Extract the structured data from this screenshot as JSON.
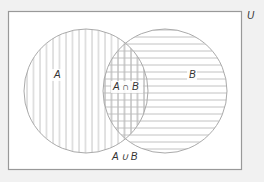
{
  "diagram": {
    "type": "venn",
    "universe_label": "U",
    "sets": [
      {
        "id": "A",
        "label": "A",
        "hatch": "vertical",
        "cx": 86,
        "cy": 91,
        "r": 62
      },
      {
        "id": "B",
        "label": "B",
        "hatch": "horizontal",
        "cx": 165,
        "cy": 91,
        "r": 62
      }
    ],
    "intersection_label": "A ∩ B",
    "union_label": "A ∪ B",
    "universe_rect": {
      "x": 8,
      "y": 11,
      "w": 234,
      "h": 159
    },
    "colors": {
      "background": "#f1f1f1",
      "universe_fill": "#ffffff",
      "universe_stroke": "#999999",
      "circle_stroke": "#aaaaaa",
      "hatch": "#bbbbbb",
      "text": "#333333"
    }
  }
}
